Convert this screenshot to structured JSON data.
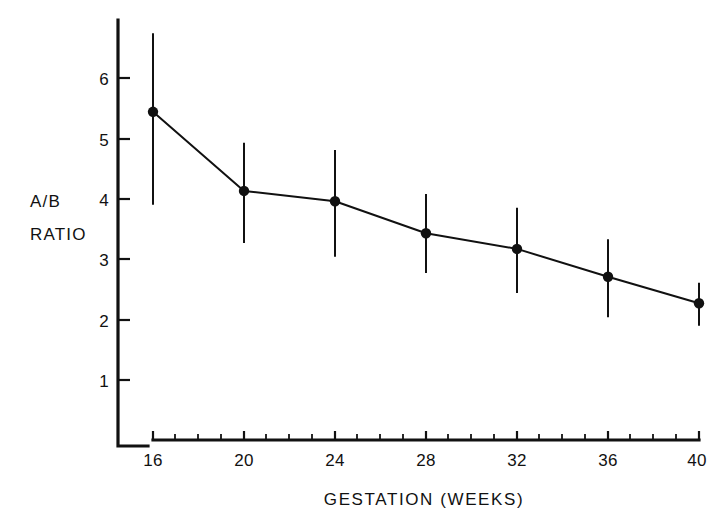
{
  "chart_data": {
    "type": "line",
    "title": "",
    "subtitle": "",
    "xlabel": "GESTATION (WEEKS)",
    "ylabel_line1": "A/B",
    "ylabel_line2": "RATIO",
    "x": [
      16,
      20,
      24,
      28,
      32,
      36,
      40
    ],
    "xtick_labels": [
      "16",
      "20",
      "24",
      "28",
      "32",
      "36",
      "40"
    ],
    "ytick_labels": [
      "1",
      "2",
      "3",
      "4",
      "5",
      "6"
    ],
    "yticks": [
      1,
      2,
      3,
      4,
      5,
      6
    ],
    "xlim": [
      15,
      41
    ],
    "ylim": [
      0,
      6.8
    ],
    "grid": false,
    "legend": "none",
    "series": [
      {
        "name": "A/B ratio (mean ± SD)",
        "values": [
          5.44,
          4.13,
          3.96,
          3.43,
          3.17,
          2.71,
          2.27
        ],
        "error_upper": [
          6.74,
          4.93,
          4.81,
          4.08,
          3.85,
          3.33,
          2.61
        ],
        "error_lower": [
          3.9,
          3.27,
          3.04,
          2.77,
          2.44,
          2.04,
          1.9
        ],
        "marker": "filled-circle",
        "color": "#111111"
      }
    ],
    "annotations": []
  },
  "axis_style": {
    "line_color": "#111111",
    "background": "#ffffff",
    "minor_tick_interval": 1
  }
}
